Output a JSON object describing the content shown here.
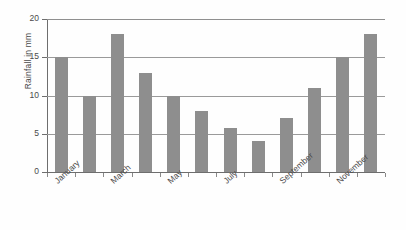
{
  "chart_data": {
    "type": "bar",
    "title": "",
    "xlabel": "",
    "ylabel": "Rainfall in mm",
    "ylim": [
      0,
      20
    ],
    "yticks": [
      0,
      5,
      10,
      15,
      20
    ],
    "grid": true,
    "legend": false,
    "categories": [
      "January",
      "February",
      "March",
      "April",
      "May",
      "June",
      "July",
      "August",
      "September",
      "October",
      "November",
      "December"
    ],
    "visible_tick_labels": [
      "January",
      "March",
      "May",
      "July",
      "September",
      "November"
    ],
    "values": [
      15,
      10,
      18,
      13,
      10,
      8,
      5.7,
      4,
      7,
      11,
      15,
      18
    ],
    "bar_color": "#8e8e8e",
    "axis_color": "#6e6e6e",
    "gridline_color": "#9a9a9a",
    "background_color": "#fefefe"
  },
  "axis": {
    "y_title": "Rainfall in mm",
    "y_tick_labels": [
      "0",
      "5",
      "10",
      "15",
      "20"
    ],
    "x_tick_labels": [
      "January",
      "March",
      "May",
      "July",
      "September",
      "November"
    ]
  }
}
